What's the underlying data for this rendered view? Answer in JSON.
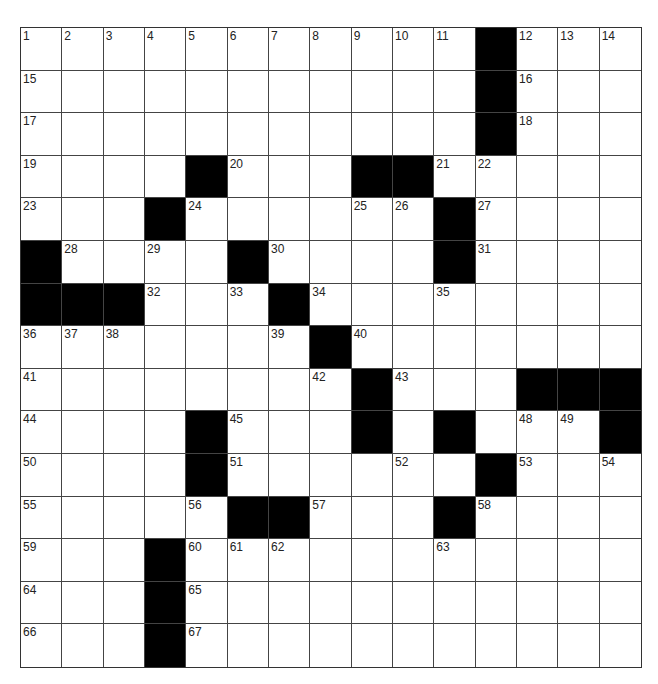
{
  "puzzle": {
    "rows": 15,
    "cols": 15,
    "colors": {
      "block": "#000000",
      "cell": "#ffffff",
      "line": "#444444"
    },
    "layout": [
      "...........#...",
      "...........#...",
      "...........#...",
      "....#...##.....",
      "...#......#....",
      "#....#....#....",
      "###...#........",
      ".......#.......",
      "........#...###",
      "....#...#.#...#",
      "....#......#...",
      ".....##...#....",
      "...#...........",
      "...#...........",
      "...#..........."
    ],
    "numbers": [
      [
        0,
        0,
        1
      ],
      [
        0,
        1,
        2
      ],
      [
        0,
        2,
        3
      ],
      [
        0,
        3,
        4
      ],
      [
        0,
        4,
        5
      ],
      [
        0,
        5,
        6
      ],
      [
        0,
        6,
        7
      ],
      [
        0,
        7,
        8
      ],
      [
        0,
        8,
        9
      ],
      [
        0,
        9,
        10
      ],
      [
        0,
        10,
        11
      ],
      [
        0,
        12,
        12
      ],
      [
        0,
        13,
        13
      ],
      [
        0,
        14,
        14
      ],
      [
        1,
        0,
        15
      ],
      [
        1,
        12,
        16
      ],
      [
        2,
        0,
        17
      ],
      [
        2,
        12,
        18
      ],
      [
        3,
        0,
        19
      ],
      [
        3,
        5,
        20
      ],
      [
        3,
        10,
        21
      ],
      [
        3,
        11,
        22
      ],
      [
        4,
        0,
        23
      ],
      [
        4,
        4,
        24
      ],
      [
        4,
        8,
        25
      ],
      [
        4,
        9,
        26
      ],
      [
        4,
        11,
        27
      ],
      [
        5,
        1,
        28
      ],
      [
        5,
        3,
        29
      ],
      [
        5,
        6,
        30
      ],
      [
        5,
        11,
        31
      ],
      [
        6,
        3,
        32
      ],
      [
        6,
        5,
        33
      ],
      [
        6,
        7,
        34
      ],
      [
        6,
        10,
        35
      ],
      [
        7,
        0,
        36
      ],
      [
        7,
        1,
        37
      ],
      [
        7,
        2,
        38
      ],
      [
        7,
        6,
        39
      ],
      [
        7,
        8,
        40
      ],
      [
        8,
        0,
        41
      ],
      [
        8,
        7,
        42
      ],
      [
        8,
        9,
        43
      ],
      [
        9,
        0,
        44
      ],
      [
        9,
        5,
        45
      ],
      [
        9,
        8,
        46
      ],
      [
        9,
        10,
        47
      ],
      [
        9,
        12,
        48
      ],
      [
        9,
        13,
        49
      ],
      [
        10,
        0,
        50
      ],
      [
        10,
        5,
        51
      ],
      [
        10,
        9,
        52
      ],
      [
        10,
        12,
        53
      ],
      [
        10,
        14,
        54
      ],
      [
        11,
        0,
        55
      ],
      [
        11,
        4,
        56
      ],
      [
        11,
        7,
        57
      ],
      [
        11,
        11,
        58
      ],
      [
        12,
        0,
        59
      ],
      [
        12,
        4,
        60
      ],
      [
        12,
        5,
        61
      ],
      [
        12,
        6,
        62
      ],
      [
        12,
        10,
        63
      ],
      [
        13,
        0,
        64
      ],
      [
        13,
        4,
        65
      ],
      [
        14,
        0,
        66
      ],
      [
        14,
        4,
        67
      ]
    ]
  }
}
